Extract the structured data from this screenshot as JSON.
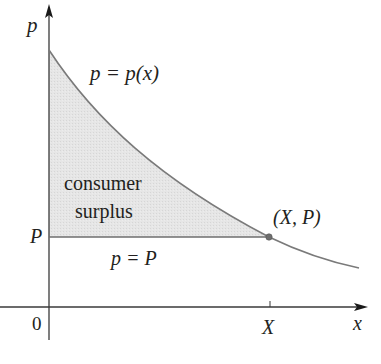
{
  "figure": {
    "axes": {
      "x_label": "x",
      "y_label": "p",
      "origin_label": "0"
    },
    "labels": {
      "demand_curve": "p = p(x)",
      "shaded_region": [
        "consumer",
        "surplus"
      ],
      "price_line": "p = P",
      "point": "(X, P)",
      "x_tick": "X",
      "y_tick": "P"
    },
    "colors": {
      "axis": "#3a3a3a",
      "curve": "#7a7a7a",
      "shade": "#e4e4e4",
      "text": "#231f20",
      "point": "#6e6e6e"
    }
  }
}
